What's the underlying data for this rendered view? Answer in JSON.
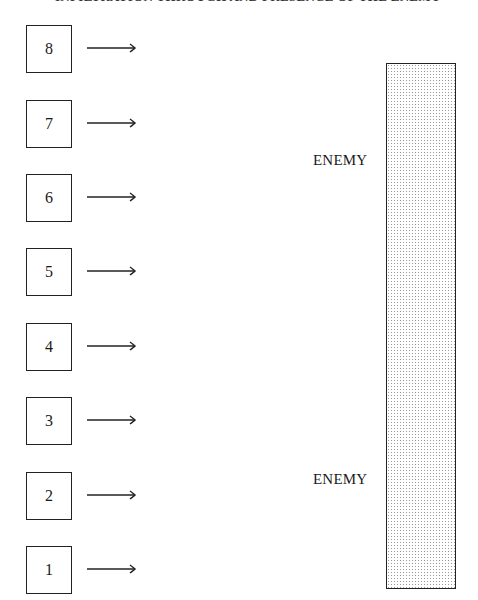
{
  "title": "INFILTRATION THROUGH AND PRESENCE OF THE ENEMY",
  "units": [
    {
      "label": "8",
      "top": 25
    },
    {
      "label": "7",
      "top": 100
    },
    {
      "label": "6",
      "top": 174
    },
    {
      "label": "5",
      "top": 248
    },
    {
      "label": "4",
      "top": 323
    },
    {
      "label": "3",
      "top": 397
    },
    {
      "label": "2",
      "top": 472
    },
    {
      "label": "1",
      "top": 546
    }
  ],
  "enemy_labels": [
    {
      "text": "ENEMY",
      "top": 152
    },
    {
      "text": "ENEMY",
      "top": 471
    }
  ],
  "enemy_block": {
    "fill": "dotted-gray",
    "border": "#222222"
  }
}
